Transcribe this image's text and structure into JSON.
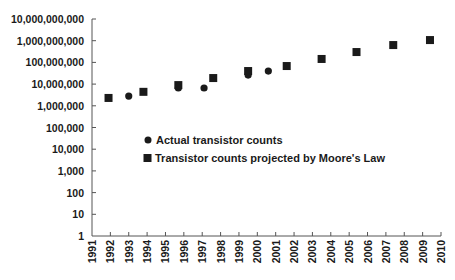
{
  "chart_data": {
    "type": "scatter",
    "title": "",
    "xlabel": "",
    "ylabel": "",
    "y_scale": "log",
    "ylim": [
      1,
      10000000000
    ],
    "xlim": [
      1991,
      2010
    ],
    "grid": false,
    "legend_position": "inside-center-left",
    "y_tick_labels": [
      "10,000,000,000",
      "1,000,000,000",
      "100,000,000",
      "10,000,000",
      "1,000,000",
      "100,000",
      "10,000",
      "1,000",
      "100",
      "10",
      "1"
    ],
    "y_tick_values": [
      10000000000,
      1000000000,
      100000000,
      10000000,
      1000000,
      100000,
      10000,
      1000,
      100,
      10,
      1
    ],
    "x_tick_labels": [
      "1991",
      "1992",
      "1993",
      "1994",
      "1995",
      "1996",
      "1997",
      "1998",
      "1999",
      "2000",
      "2001",
      "2002",
      "2003",
      "2004",
      "2005",
      "2006",
      "2007",
      "2008",
      "2009",
      "2010"
    ],
    "series": [
      {
        "name": "Actual transistor counts",
        "marker": "circle",
        "color": "#1a1a1a",
        "points": [
          {
            "x": 1993.0,
            "y": 2800000
          },
          {
            "x": 1995.7,
            "y": 6600000
          },
          {
            "x": 1997.1,
            "y": 6600000
          },
          {
            "x": 1999.5,
            "y": 26000000
          },
          {
            "x": 2000.6,
            "y": 40000000
          }
        ]
      },
      {
        "name": "Transistor counts projected by Moore's Law",
        "marker": "square",
        "color": "#1a1a1a",
        "points": [
          {
            "x": 1991.9,
            "y": 2300000
          },
          {
            "x": 1993.8,
            "y": 4400000
          },
          {
            "x": 1995.7,
            "y": 9000000
          },
          {
            "x": 1997.6,
            "y": 19000000
          },
          {
            "x": 1999.5,
            "y": 40000000
          },
          {
            "x": 2001.6,
            "y": 68000000
          },
          {
            "x": 2003.5,
            "y": 144000000
          },
          {
            "x": 2005.4,
            "y": 300000000
          },
          {
            "x": 2007.4,
            "y": 630000000
          },
          {
            "x": 2009.4,
            "y": 1070000000
          }
        ]
      }
    ]
  },
  "legend": {
    "items": [
      {
        "label": "Actual transistor counts",
        "marker": "circle"
      },
      {
        "label": "Transistor counts projected by Moore's Law",
        "marker": "square"
      }
    ]
  }
}
